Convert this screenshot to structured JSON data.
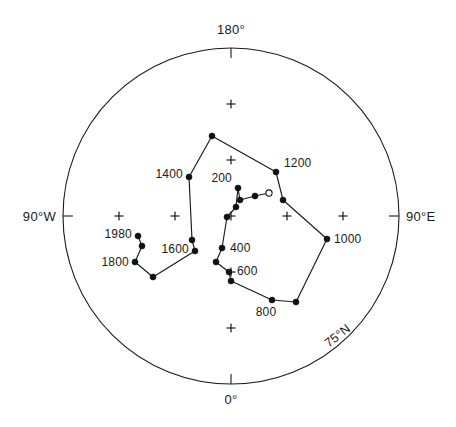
{
  "chart_data": {
    "type": "scatter",
    "title": "",
    "subtitle": "",
    "projection": "polar-azimuthal",
    "xlabel": "",
    "ylabel": "",
    "grid": true,
    "legend_position": "none",
    "center_px": [
      231,
      216
    ],
    "radius_px": 168,
    "outer_latitude_deg": 75,
    "grid_spacing_deg": 5,
    "grid_spacing_px": 56,
    "axis_labels": [
      {
        "name": "top",
        "text": "180°",
        "x": 231,
        "y": 34,
        "anchor": "middle"
      },
      {
        "name": "bottom",
        "text": "0°",
        "x": 231,
        "y": 404,
        "anchor": "middle"
      },
      {
        "name": "left",
        "text": "90°W",
        "x": 56,
        "y": 221,
        "anchor": "end"
      },
      {
        "name": "right",
        "text": "90°E",
        "x": 406,
        "y": 221,
        "anchor": "start"
      }
    ],
    "latitude_ring_label": {
      "text": "75°N",
      "x": 340,
      "y": 339,
      "rotation": -38
    },
    "tick_marks": [
      {
        "name": "tick-180",
        "x1": 231,
        "y1": 48,
        "x2": 231,
        "y2": 58
      },
      {
        "name": "tick-0",
        "x1": 231,
        "y1": 384,
        "x2": 231,
        "y2": 374
      },
      {
        "name": "tick-90W",
        "x1": 63,
        "y1": 216,
        "x2": 73,
        "y2": 216
      },
      {
        "name": "tick-90E",
        "x1": 399,
        "y1": 216,
        "x2": 389,
        "y2": 216
      }
    ],
    "grid_crosses": [
      {
        "name": "cross-top",
        "x": 231,
        "y": 104
      },
      {
        "name": "cross-upper-mid",
        "x": 231,
        "y": 160
      },
      {
        "name": "cross-center",
        "x": 231,
        "y": 216
      },
      {
        "name": "cross-lower-mid",
        "x": 231,
        "y": 272
      },
      {
        "name": "cross-bottom",
        "x": 231,
        "y": 328
      },
      {
        "name": "cross-left-outer",
        "x": 119,
        "y": 216
      },
      {
        "name": "cross-left-inner",
        "x": 175,
        "y": 216
      },
      {
        "name": "cross-right-inner",
        "x": 287,
        "y": 216
      },
      {
        "name": "cross-right-outer",
        "x": 343,
        "y": 216
      }
    ],
    "series": [
      {
        "name": "apparent-polar-wander-path",
        "marker": "filled-circle",
        "points": [
          {
            "x": 269,
            "y": 193,
            "marker": "open-circle",
            "label": ""
          },
          {
            "x": 255,
            "y": 196,
            "marker": "filled-circle",
            "label": ""
          },
          {
            "x": 240,
            "y": 200,
            "marker": "filled-circle",
            "label": ""
          },
          {
            "x": 238,
            "y": 188,
            "marker": "filled-circle",
            "label": "200"
          },
          {
            "x": 236,
            "y": 207,
            "marker": "filled-circle",
            "label": ""
          },
          {
            "x": 227,
            "y": 217,
            "marker": "filled-circle",
            "label": ""
          },
          {
            "x": 222,
            "y": 248,
            "marker": "filled-circle",
            "label": "400"
          },
          {
            "x": 216,
            "y": 262,
            "marker": "filled-circle",
            "label": ""
          },
          {
            "x": 229,
            "y": 272,
            "marker": "filled-circle",
            "label": "600"
          },
          {
            "x": 231,
            "y": 281,
            "marker": "filled-circle",
            "label": ""
          },
          {
            "x": 272,
            "y": 300,
            "marker": "filled-circle",
            "label": "800"
          },
          {
            "x": 296,
            "y": 302,
            "marker": "filled-circle",
            "label": ""
          },
          {
            "x": 327,
            "y": 239,
            "marker": "filled-circle",
            "label": "1000"
          },
          {
            "x": 283,
            "y": 200,
            "marker": "filled-circle",
            "label": ""
          },
          {
            "x": 276,
            "y": 172,
            "marker": "filled-circle",
            "label": "1200"
          },
          {
            "x": 212,
            "y": 136,
            "marker": "filled-circle",
            "label": ""
          },
          {
            "x": 189,
            "y": 177,
            "marker": "filled-circle",
            "label": "1400"
          },
          {
            "x": 192,
            "y": 240,
            "marker": "filled-circle",
            "label": ""
          },
          {
            "x": 195,
            "y": 251,
            "marker": "filled-circle",
            "label": "1600"
          },
          {
            "x": 153,
            "y": 277,
            "marker": "filled-circle",
            "label": ""
          },
          {
            "x": 135,
            "y": 262,
            "marker": "filled-circle",
            "label": "1800"
          },
          {
            "x": 142,
            "y": 246,
            "marker": "filled-circle",
            "label": ""
          },
          {
            "x": 138,
            "y": 236,
            "marker": "filled-circle",
            "label": "1980"
          }
        ],
        "path_order": [
          "open-circle-end",
          "200",
          "400",
          "600",
          "800",
          "1000",
          "1200",
          "1400",
          "1600",
          "1800",
          "1980"
        ]
      }
    ],
    "point_labels": [
      {
        "name": "label-200",
        "text": "200",
        "x": 232,
        "y": 182,
        "anchor": "end"
      },
      {
        "name": "label-400",
        "text": "400",
        "x": 230,
        "y": 252,
        "anchor": "start"
      },
      {
        "name": "label-600",
        "text": "600",
        "x": 237,
        "y": 275,
        "anchor": "start"
      },
      {
        "name": "label-800",
        "text": "800",
        "x": 266,
        "y": 316,
        "anchor": "middle"
      },
      {
        "name": "label-1000",
        "text": "1000",
        "x": 334,
        "y": 243,
        "anchor": "start"
      },
      {
        "name": "label-1200",
        "text": "1200",
        "x": 284,
        "y": 167,
        "anchor": "start"
      },
      {
        "name": "label-1400",
        "text": "1400",
        "x": 183,
        "y": 178,
        "anchor": "end"
      },
      {
        "name": "label-1600",
        "text": "1600",
        "x": 189,
        "y": 253,
        "anchor": "end"
      },
      {
        "name": "label-1800",
        "text": "1800",
        "x": 129,
        "y": 266,
        "anchor": "end"
      },
      {
        "name": "label-1980",
        "text": "1980",
        "x": 132,
        "y": 238,
        "anchor": "end"
      }
    ]
  },
  "colors": {
    "background": "#ffffff",
    "line": "#1a1a1a",
    "marker": "#111111",
    "text": "#1a1a1a"
  }
}
